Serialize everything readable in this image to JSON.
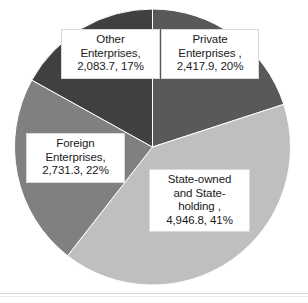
{
  "chart_data": {
    "type": "pie",
    "title": "",
    "subtitle": "",
    "xlabel": "",
    "ylabel": "",
    "legend_position": "none",
    "grid": false,
    "label_format": "name, value, percent",
    "total": 12179.7,
    "categories": [
      "Private Enterprises",
      "State-owned and State-holding",
      "Foreign Enterprises",
      "Other Enterprises"
    ],
    "values": [
      2417.9,
      4946.8,
      2731.3,
      2083.7
    ],
    "percents": [
      20,
      41,
      22,
      17
    ],
    "colors": [
      "#595959",
      "#bfbfbf",
      "#808080",
      "#404040"
    ],
    "slices": [
      {
        "name": "Private Enterprises",
        "value": 2417.9,
        "value_text": "2,417.9",
        "percent": 20,
        "percent_text": "20%",
        "color": "#595959",
        "start_angle_deg": 0,
        "end_angle_deg": 72
      },
      {
        "name": "State-owned and State-holding",
        "value": 4946.8,
        "value_text": "4,946.8",
        "percent": 41,
        "percent_text": "41%",
        "color": "#bfbfbf",
        "start_angle_deg": 72,
        "end_angle_deg": 218
      },
      {
        "name": "Foreign Enterprises",
        "value": 2731.3,
        "value_text": "2,731.3",
        "percent": 22,
        "percent_text": "22%",
        "color": "#808080",
        "start_angle_deg": 218,
        "end_angle_deg": 299
      },
      {
        "name": "Other Enterprises",
        "value": 2083.7,
        "value_text": "2,083.7",
        "percent": 17,
        "percent_text": "17%",
        "color": "#404040",
        "start_angle_deg": 299,
        "end_angle_deg": 360
      }
    ]
  },
  "labels": {
    "other": "Other\nEnterprises,\n2,083.7, 17%",
    "private": "Private\nEnterprises ,\n2,417.9, 20%",
    "foreign": "Foreign\nEnterprises,\n2,731.3, 22%",
    "state": "State-owned\nand State-\nholding ,\n4,946.8, 41%"
  }
}
